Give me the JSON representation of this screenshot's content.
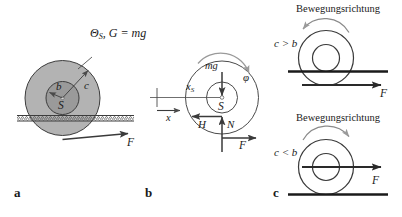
{
  "figure": {
    "panels": [
      {
        "id": "a",
        "letter": "a",
        "labels": {
          "inertia_weight": "Θ",
          "inertia_weight_sub": "S",
          "inertia_weight_rest": ", G = mg",
          "inner_radius": "b",
          "outer_radius": "c",
          "center": "S",
          "force": "F"
        },
        "colors": {
          "outer_disc_fill": "#b3b3b3",
          "inner_disc_fill": "#9a9a9a",
          "outline": "#3c3c3c",
          "rail_fill": "#d9d9d9"
        }
      },
      {
        "id": "b",
        "letter": "b",
        "labels": {
          "weight": "mg",
          "rotation": "φ",
          "center_coord": "x",
          "center_coord_sub": "S",
          "center": "S",
          "friction": "H",
          "normal": "N",
          "force": "F",
          "axis": "x"
        },
        "colors": {
          "outline": "#4a4a4a",
          "arrow": "#3a3a3a"
        }
      },
      {
        "id": "c",
        "letter": "c",
        "cases": [
          {
            "caption": "Bewegungsrichtung",
            "condition": "c > b",
            "force": "F",
            "rotation_direction": "left"
          },
          {
            "caption": "Bewegungsrichtung",
            "condition": "c < b",
            "force": "F",
            "rotation_direction": "right"
          }
        ],
        "colors": {
          "outline": "#3a3a3a",
          "ground": "#1a1a1a"
        }
      }
    ]
  }
}
